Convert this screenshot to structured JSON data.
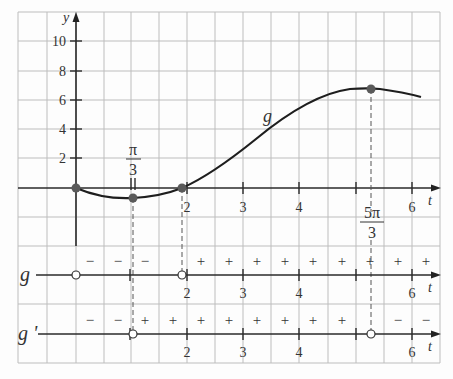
{
  "graph": {
    "y_axis_label": "y",
    "x_axis_label": "t",
    "curve_label": "g",
    "y_ticks": [
      {
        "value": 2,
        "label": "2"
      },
      {
        "value": 4,
        "label": "4"
      },
      {
        "value": 6,
        "label": "6"
      },
      {
        "value": 8,
        "label": "8"
      },
      {
        "value": 10,
        "label": "10"
      }
    ],
    "x_ticks": [
      {
        "value": 2,
        "label": "2"
      },
      {
        "value": 3,
        "label": "3"
      },
      {
        "value": 4,
        "label": "4"
      },
      {
        "value": 5,
        "label": ""
      },
      {
        "value": 6,
        "label": "6"
      }
    ],
    "special_points": {
      "pi_over_3": {
        "numerator": "π",
        "denominator": "3",
        "x": 1.047
      },
      "five_pi_over_3": {
        "numerator": "5π",
        "denominator": "3",
        "x": 5.236
      }
    },
    "marked_points": [
      {
        "t": 0,
        "y": 0
      },
      {
        "t": 1.047,
        "y": -0.68
      },
      {
        "t": 1.9,
        "y": 0
      },
      {
        "t": 5.236,
        "y": 6.68
      }
    ]
  },
  "sign_tables": [
    {
      "label": "g",
      "x_ticks": [
        "2",
        "3",
        "4",
        "6"
      ],
      "axis_label": "t",
      "signs": [
        "−",
        "−",
        "−",
        "+",
        "+",
        "+",
        "+",
        "+",
        "+",
        "+",
        "+",
        "+"
      ],
      "zeros": [
        "0",
        "1.9"
      ]
    },
    {
      "label": "g '",
      "x_ticks": [
        "2",
        "3",
        "4",
        "6"
      ],
      "axis_label": "t",
      "signs": [
        "−",
        "−",
        "+",
        "+",
        "+",
        "+",
        "+",
        "+",
        "+",
        "+",
        "+",
        "−",
        "−"
      ],
      "zeros": [
        "π/3",
        "5π/3"
      ]
    }
  ]
}
